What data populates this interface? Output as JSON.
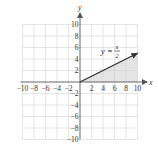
{
  "chart_data": {
    "type": "line",
    "title": "",
    "xlabel": "x",
    "ylabel": "y",
    "xlim": [
      -10,
      10
    ],
    "ylim": [
      -10,
      10
    ],
    "grid": true,
    "x_ticks": [
      -10,
      -8,
      -6,
      -4,
      -2,
      2,
      4,
      6,
      8,
      10
    ],
    "y_ticks": [
      10,
      8,
      6,
      4,
      2,
      -2,
      -4,
      -6,
      -8,
      -10
    ],
    "series": [
      {
        "name": "y = x/2",
        "equation": "y = x/2",
        "x": [
          0,
          10
        ],
        "y": [
          0,
          5
        ],
        "style": "ray with arrowhead",
        "color": "#333333"
      }
    ],
    "shaded_region": {
      "description": "region between y = x/2 and the x-axis for 0 <= x <= 10",
      "vertices": [
        [
          0,
          0
        ],
        [
          10,
          0
        ],
        [
          10,
          5
        ]
      ],
      "color": "#e4e4e4"
    },
    "annotations": [
      {
        "text": "y = x/2",
        "x": 6.5,
        "y": 6
      }
    ]
  },
  "labels": {
    "x_axis": "x",
    "y_axis": "y",
    "equation_lhs": "y =",
    "equation_num": "x",
    "equation_den": "2",
    "x_tick_labels": [
      "−10",
      "−8",
      "−6",
      "−4",
      "−2",
      "2",
      "4",
      "6",
      "8",
      "10"
    ],
    "y_tick_labels_pos": [
      "10",
      "8",
      "6",
      "4",
      "2"
    ],
    "y_tick_labels_neg": [
      "−2",
      "−4",
      "−6",
      "−8",
      "−10"
    ]
  },
  "colors": {
    "grid": "#d4d4d4",
    "axis": "#555555",
    "line": "#333333",
    "shade": "#e4e4e4"
  }
}
